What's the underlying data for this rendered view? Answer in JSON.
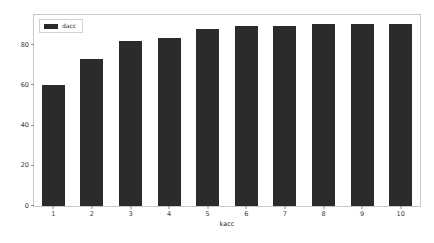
{
  "chart_data": {
    "type": "bar",
    "title": "",
    "xlabel": "kacc",
    "ylabel": "",
    "categories": [
      "1",
      "2",
      "3",
      "4",
      "5",
      "6",
      "7",
      "8",
      "9",
      "10"
    ],
    "values": [
      60,
      73,
      82,
      83.5,
      88,
      89.5,
      89.5,
      90.5,
      90.5,
      90.5
    ],
    "series": [
      {
        "name": "dacc",
        "values": [
          60,
          73,
          82,
          83.5,
          88,
          89.5,
          89.5,
          90.5,
          90.5,
          90.5
        ],
        "color": "#2b2b2b"
      }
    ],
    "ylim": [
      0,
      95
    ],
    "xlim": [
      0.5,
      10.5
    ],
    "yticks": [
      0,
      20,
      40,
      60,
      80
    ],
    "ytick_labels": [
      "0",
      "20",
      "40",
      "60",
      "80"
    ],
    "xticks": [
      1,
      2,
      3,
      4,
      5,
      6,
      7,
      8,
      9,
      10
    ],
    "xtick_labels": [
      "1",
      "2",
      "3",
      "4",
      "5",
      "6",
      "7",
      "8",
      "9",
      "10"
    ],
    "grid": false,
    "legend": {
      "entries": [
        {
          "label": "dacc",
          "color": "#2b2b2b"
        }
      ],
      "position": "upper left"
    },
    "bar_color": "#2b2b2b",
    "frame_color": "#c8c8c8",
    "background_color": "#ffffff"
  }
}
